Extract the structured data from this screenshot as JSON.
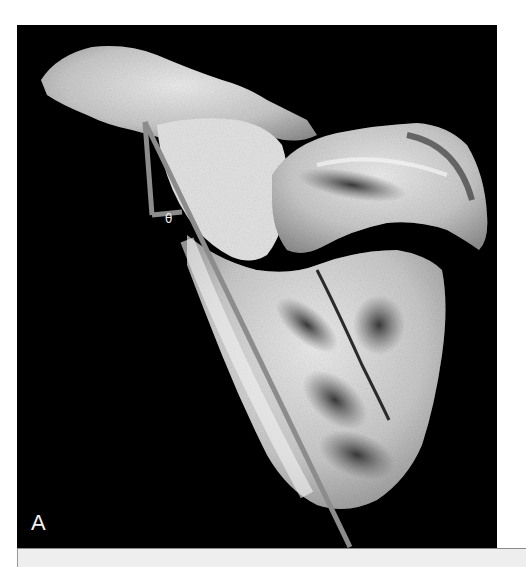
{
  "figure": {
    "panel_label": "A",
    "angle_label": "θ",
    "colors": {
      "background": "#000000",
      "bone_light": "#e6e6e6",
      "bone_mid": "#a9a9a9",
      "bone_dark": "#4a4a4a",
      "measure_line": "#8c8c8c",
      "caption_bar": "#eeeeee"
    }
  },
  "measurement": {
    "long_line": {
      "x1": 128,
      "y1": 97,
      "x2": 333,
      "y2": 522
    },
    "vertical_line": {
      "x1": 128,
      "y1": 97,
      "x2": 135,
      "y2": 190
    },
    "base_line": {
      "x1": 135,
      "y1": 190,
      "x2": 165,
      "y2": 187
    }
  }
}
